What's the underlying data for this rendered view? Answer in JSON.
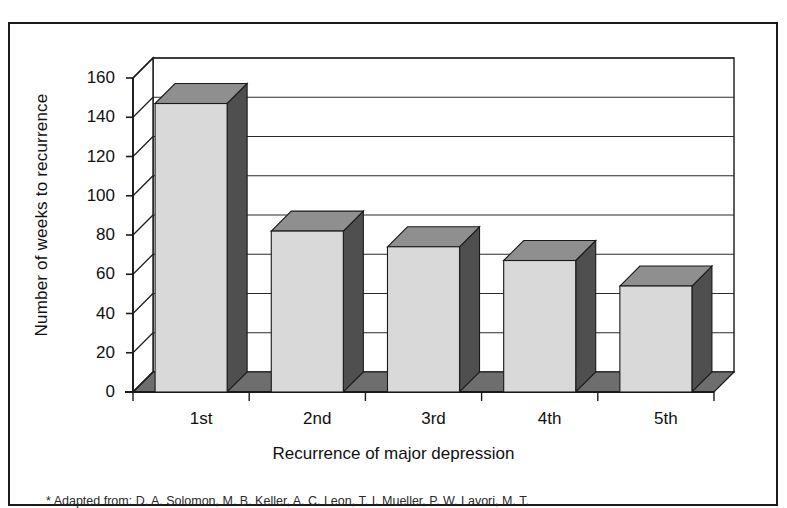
{
  "figure": {
    "caption": "* Adapted from: D. A. Solomon, M. B. Keller, A. C. Leon, T. I. Mueller, P. W. Lavori, M. T."
  },
  "chart_data": {
    "type": "bar",
    "title": "",
    "xlabel": "Recurrence of major depression",
    "ylabel": "Number of weeks to recurrence",
    "categories": [
      "1st",
      "2nd",
      "3rd",
      "4th",
      "5th"
    ],
    "values": [
      147,
      82,
      74,
      67,
      54
    ],
    "ylim": [
      0,
      160
    ],
    "yticks": [
      0,
      20,
      40,
      60,
      80,
      100,
      120,
      140,
      160
    ],
    "ytick_labels": [
      "0",
      "20",
      "40",
      "60",
      "80",
      "100",
      "120",
      "140",
      "160"
    ],
    "grid": true,
    "legend": "none",
    "style": "3d-column",
    "colors": {
      "bar_front": "#d9d9d9",
      "bar_side": "#4f4f4f",
      "bar_top": "#8f8f8f",
      "floor": "#6e6e6e",
      "axis": "#1a1a1a",
      "grid": "#2b2b2b",
      "background": "#ffffff"
    }
  }
}
